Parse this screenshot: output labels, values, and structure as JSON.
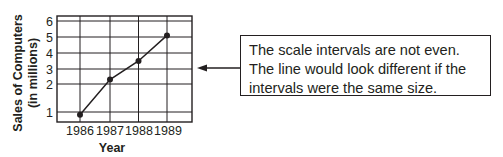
{
  "chart_data": {
    "type": "line",
    "title": "",
    "xlabel": "Year",
    "ylabel": "Sales of Computers (in millions)",
    "ylabel_lines": [
      "Sales of Computers",
      "(in millions)"
    ],
    "categories": [
      "1986",
      "1987",
      "1988",
      "1989"
    ],
    "x": [
      1986,
      1987,
      1988,
      1989
    ],
    "series": [
      {
        "name": "Sales of Computers",
        "values": [
          0.9,
          2.3,
          3.5,
          5.1
        ]
      }
    ],
    "y_ticks": [
      "1",
      "2",
      "3",
      "4",
      "5",
      "6"
    ],
    "ylim": [
      0.7,
      6.3
    ],
    "grid": true,
    "legend": "none",
    "note": "uneven y-axis scale intervals"
  },
  "callout": {
    "lines": [
      "The scale intervals are not even.",
      "The line would look different if the",
      "intervals were the same size."
    ],
    "arrow_direction": "left",
    "arrow_icon": "left-arrow-icon"
  },
  "colors": {
    "ink": "#231f20",
    "background": "#ffffff"
  }
}
